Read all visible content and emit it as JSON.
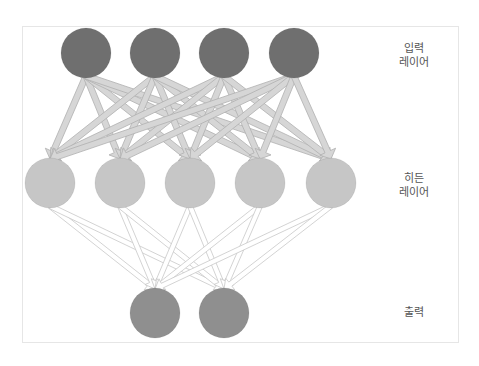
{
  "diagram": {
    "type": "neural-network",
    "colors": {
      "input_node": "#6f6f6f",
      "hidden_node": "#c6c6c6",
      "output_node": "#8f8f8f",
      "edge_in_hidden_fill": "#d6d6d6",
      "edge_in_hidden_stroke": "#b0b0b0",
      "edge_hidden_out_fill": "#ffffff",
      "edge_hidden_out_stroke": "#c8c8c8",
      "frame": "#e6e6e6",
      "label_text": "#555555"
    },
    "layers": [
      {
        "id": "input",
        "label_lines": [
          "입력",
          "레이어"
        ],
        "label_pos": {
          "x": 384,
          "y": 42
        },
        "node_count": 4,
        "y": 53,
        "xs": [
          86,
          155,
          224,
          294
        ],
        "radius": 25
      },
      {
        "id": "hidden",
        "label_lines": [
          "히든",
          "레이어"
        ],
        "label_pos": {
          "x": 384,
          "y": 172
        },
        "node_count": 5,
        "y": 183,
        "xs": [
          50,
          120,
          190,
          260,
          331
        ],
        "radius": 25
      },
      {
        "id": "output",
        "label_lines": [
          "출력"
        ],
        "label_pos": {
          "x": 384,
          "y": 306
        },
        "node_count": 2,
        "y": 313,
        "xs": [
          155,
          224
        ],
        "radius": 25
      }
    ],
    "connections": "fully-connected between consecutive layers"
  }
}
